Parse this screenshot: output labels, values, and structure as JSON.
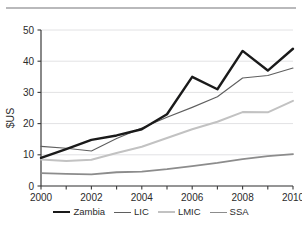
{
  "figure": {
    "name": "line-chart-figure",
    "background_color": "#ffffff",
    "rule_color": "#b9b9bb"
  },
  "chart_data": {
    "type": "line",
    "title": "",
    "subtitle": "",
    "xlabel": "",
    "ylabel": "$US",
    "x": [
      2000,
      2001,
      2002,
      2003,
      2004,
      2005,
      2006,
      2007,
      2008,
      2009,
      2010
    ],
    "xlim": [
      2000,
      2010
    ],
    "ylim": [
      0,
      50
    ],
    "xticks": [
      2000,
      2001,
      2002,
      2003,
      2004,
      2005,
      2006,
      2007,
      2008,
      2009,
      2010
    ],
    "xtick_labels": [
      "2000",
      "",
      "2002",
      "",
      "2004",
      "",
      "2006",
      "",
      "2008",
      "",
      "2010"
    ],
    "yticks": [
      0,
      10,
      20,
      30,
      40,
      50
    ],
    "ytick_labels": [
      "0",
      "10",
      "20",
      "30",
      "40",
      "50"
    ],
    "grid": true,
    "grid_axis": "y",
    "grid_color": "#e2e2e4",
    "legend_position": "bottom",
    "series": [
      {
        "name": "Zambia",
        "color": "#1a1a1a",
        "width": 2.4,
        "values": [
          9.0,
          11.8,
          14.8,
          16.2,
          18.2,
          23.0,
          35.0,
          31.0,
          43.3,
          37.0,
          44.0
        ]
      },
      {
        "name": "LIC",
        "color": "#5f5f5f",
        "width": 1.1,
        "values": [
          12.7,
          12.1,
          11.2,
          15.2,
          18.6,
          22.0,
          25.2,
          28.6,
          34.6,
          35.4,
          37.8
        ]
      },
      {
        "name": "LMIC",
        "color": "#c2c2c2",
        "width": 2.0,
        "values": [
          8.5,
          8.0,
          8.4,
          10.6,
          12.6,
          15.4,
          18.2,
          20.6,
          23.7,
          23.6,
          27.3
        ]
      },
      {
        "name": "SSA",
        "color": "#8c8c8c",
        "width": 1.8,
        "values": [
          4.1,
          3.9,
          3.7,
          4.4,
          4.6,
          5.4,
          6.4,
          7.4,
          8.6,
          9.6,
          10.2
        ]
      }
    ]
  }
}
